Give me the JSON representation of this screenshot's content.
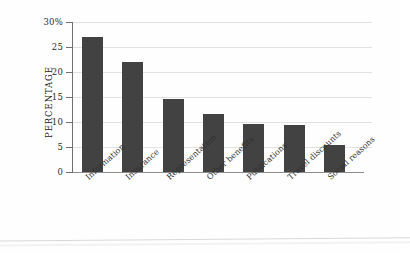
{
  "chart_data": {
    "type": "bar",
    "title": "",
    "xlabel": "",
    "ylabel": "PERCENTAGE",
    "ylim": [
      0,
      30
    ],
    "yticks": [
      0,
      5,
      10,
      15,
      20,
      25,
      30
    ],
    "ytick_labels": [
      "0",
      "5",
      "10",
      "15",
      "20",
      "25",
      "30%"
    ],
    "grid": true,
    "legend": "none",
    "bar_color": "#424242",
    "gridline_color": "#e2e2e2",
    "axis_color": "#6f6f6f",
    "categories": [
      "Information",
      "Insurance",
      "Representation",
      "Other benefits",
      "Publications",
      "Travel discounts",
      "Social reasons"
    ],
    "values": [
      27.0,
      22.0,
      14.7,
      11.7,
      9.6,
      9.4,
      5.4
    ]
  }
}
